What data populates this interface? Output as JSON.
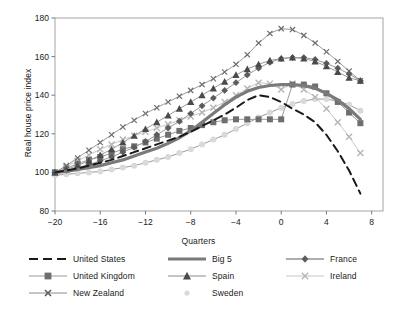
{
  "chart_data": {
    "type": "line",
    "title": "",
    "xlabel": "Quarters",
    "ylabel": "Real house price index",
    "xlim": [
      -20,
      9
    ],
    "ylim": [
      80,
      180
    ],
    "xticks": [
      -20,
      -16,
      -12,
      -8,
      -4,
      0,
      4,
      8
    ],
    "yticks": [
      80,
      100,
      120,
      140,
      160,
      180
    ],
    "grid": false,
    "legend_position": "below",
    "x": [
      -20,
      -19,
      -18,
      -17,
      -16,
      -15,
      -14,
      -13,
      -12,
      -11,
      -10,
      -9,
      -8,
      -7,
      -6,
      -5,
      -4,
      -3,
      -2,
      -1,
      0,
      1,
      2,
      3,
      4,
      5,
      6,
      7
    ],
    "series": [
      {
        "name": "United States",
        "marker": "none",
        "line": "dashed",
        "color": "#1a1a1a",
        "width": 2.0,
        "values": [
          100.0,
          101.0,
          102.0,
          103.5,
          105.0,
          106.5,
          108.5,
          110.5,
          112.5,
          114.5,
          116.5,
          118.5,
          121.0,
          124.0,
          127.0,
          130.0,
          133.5,
          137.5,
          140.0,
          139.0,
          136.5,
          133.0,
          130.0,
          126.0,
          119.5,
          111.0,
          101.0,
          89.0
        ]
      },
      {
        "name": "Big 5",
        "marker": "none",
        "line": "solid-thick",
        "color": "#7a7a7a",
        "width": 3.2,
        "values": [
          100.0,
          100.5,
          101.5,
          102.5,
          103.5,
          105.0,
          106.5,
          108.5,
          110.5,
          112.5,
          115.0,
          118.0,
          121.5,
          126.0,
          130.5,
          135.0,
          139.0,
          142.0,
          144.0,
          145.0,
          145.5,
          145.5,
          145.0,
          143.5,
          141.0,
          137.5,
          133.0,
          127.5
        ]
      },
      {
        "name": "France",
        "marker": "diamond",
        "line": "solid",
        "color": "#5c5c5c",
        "width": 1.0,
        "values": [
          100.0,
          101.0,
          102.5,
          104.0,
          106.0,
          108.0,
          110.5,
          113.0,
          116.0,
          119.5,
          123.0,
          126.5,
          130.5,
          134.5,
          138.5,
          142.5,
          146.5,
          150.5,
          154.0,
          157.0,
          159.0,
          159.5,
          159.5,
          158.5,
          156.5,
          154.0,
          151.0,
          147.5
        ]
      },
      {
        "name": "United Kingdom",
        "marker": "square",
        "line": "solid",
        "color": "#6e6e6e",
        "width": 1.0,
        "values": [
          100.0,
          102.0,
          104.5,
          106.5,
          108.0,
          110.0,
          112.0,
          113.5,
          115.5,
          117.5,
          119.5,
          121.5,
          123.0,
          124.5,
          126.0,
          127.0,
          127.5,
          127.5,
          127.5,
          127.5,
          127.5,
          145.5,
          145.5,
          144.5,
          141.0,
          136.5,
          131.0,
          125.5
        ]
      },
      {
        "name": "Spain",
        "marker": "triangle",
        "line": "solid",
        "color": "#4a4a4a",
        "width": 1.0,
        "values": [
          100.0,
          101.5,
          103.5,
          106.0,
          109.0,
          112.0,
          115.5,
          119.0,
          122.5,
          126.0,
          129.5,
          133.0,
          136.5,
          140.0,
          143.5,
          147.0,
          150.5,
          153.5,
          156.0,
          158.0,
          159.0,
          159.5,
          159.0,
          157.5,
          155.0,
          152.0,
          149.0,
          147.5
        ]
      },
      {
        "name": "Ireland",
        "marker": "x",
        "line": "solid-light",
        "color": "#b5b5b5",
        "width": 1.0,
        "values": [
          100.0,
          103.0,
          106.0,
          109.0,
          112.0,
          114.5,
          117.0,
          119.0,
          121.0,
          123.0,
          125.0,
          127.0,
          129.0,
          131.0,
          133.5,
          136.5,
          140.0,
          143.5,
          146.5,
          146.0,
          143.0,
          146.0,
          143.0,
          139.0,
          133.0,
          126.0,
          118.5,
          110.0
        ]
      },
      {
        "name": "New Zealand",
        "marker": "x-small",
        "line": "solid",
        "color": "#6e6e6e",
        "width": 1.0,
        "values": [
          100.0,
          103.5,
          107.5,
          111.5,
          115.5,
          119.5,
          123.5,
          127.0,
          130.5,
          133.5,
          136.5,
          139.5,
          142.5,
          145.5,
          148.5,
          152.0,
          156.0,
          161.0,
          167.0,
          172.0,
          174.5,
          174.0,
          171.0,
          167.0,
          162.5,
          157.5,
          152.5,
          147.5
        ]
      },
      {
        "name": "Sweden",
        "marker": "dot",
        "line": "dotted-light",
        "color": "#d9d9d9",
        "width": 1.0,
        "values": [
          98.5,
          99.0,
          99.5,
          100.0,
          100.5,
          101.5,
          102.5,
          103.5,
          105.0,
          106.5,
          108.0,
          110.0,
          112.0,
          114.5,
          117.0,
          119.5,
          122.5,
          125.5,
          128.5,
          131.0,
          133.5,
          135.5,
          137.0,
          138.0,
          138.0,
          137.0,
          135.0,
          132.0
        ]
      }
    ]
  },
  "legend": {
    "items": [
      {
        "label": "United States",
        "key": "dashed-line-key"
      },
      {
        "label": "Big 5",
        "key": "thick-line-key"
      },
      {
        "label": "France",
        "key": "diamond-marker-key"
      },
      {
        "label": "United Kingdom",
        "key": "square-marker-key"
      },
      {
        "label": "Spain",
        "key": "triangle-marker-key"
      },
      {
        "label": "Ireland",
        "key": "x-light-marker-key"
      },
      {
        "label": "New Zealand",
        "key": "x-marker-key"
      },
      {
        "label": "Sweden",
        "key": "dot-marker-key"
      }
    ]
  }
}
